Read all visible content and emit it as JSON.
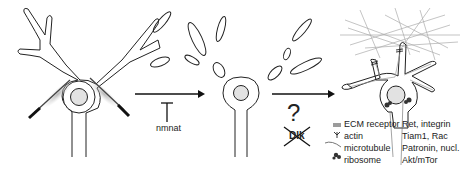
{
  "diagram": {
    "stage1": {
      "name": "intact neuron with dendrites being severed"
    },
    "stage2": {
      "name": "degenerating dendrite fragments"
    },
    "stage3": {
      "name": "regenerated neuron with ECM"
    },
    "arrow1": {
      "inhibitor_label": "nmnat"
    },
    "arrow2": {
      "question": "?",
      "crossed_label": "Dlk"
    },
    "legend": [
      {
        "icon": "ecm-receptor-icon",
        "label": "ECM receptor"
      },
      {
        "icon": "actin-icon",
        "label": "actin"
      },
      {
        "icon": "microtubule-icon",
        "label": "microtubule"
      },
      {
        "icon": "ribosome-icon",
        "label": "ribosome"
      }
    ],
    "molecules": [
      "Ret, integrin",
      "Tiam1, Rac",
      "Patronin, nucl.",
      "Akt/mTor"
    ]
  }
}
